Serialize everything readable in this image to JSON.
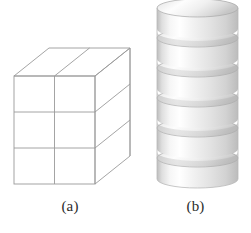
{
  "figure": {
    "background_color": "#ffffff",
    "width": 251,
    "height": 233,
    "panels": [
      {
        "id": "a",
        "caption": "(a)",
        "subject": "wireframe-rectangular-box",
        "description": "Wireframe rectangular box drawn in oblique projection, subdivided into unit cubes",
        "line_color": "#9a9a9a",
        "fill_color": "#ffffff",
        "grid": {
          "columns": 2,
          "rows": 3,
          "layers": 1
        },
        "geometry": {
          "front_top_left": [
            14,
            76
          ],
          "front_top_right": [
            95,
            76
          ],
          "front_bottom_left": [
            14,
            184
          ],
          "front_bottom_right": [
            95,
            184
          ],
          "depth_offset_x": 35,
          "depth_offset_y": -28
        }
      },
      {
        "id": "b",
        "caption": "(b)",
        "subject": "stacked-cylinder-discs",
        "description": "Vertical stack of six shaded cylindrical discs with elliptical tops",
        "disc_count": 6,
        "highlight_color": "#ffffff",
        "midtone_color": "#e8e8e8",
        "shadow_color": "#b4b4b4",
        "edge_color": "#9c9c9c",
        "geometry": {
          "left": 17,
          "right": 98,
          "top": 6,
          "bottom": 188,
          "disc_height": 30,
          "ellipse_ry": 9
        }
      }
    ]
  }
}
